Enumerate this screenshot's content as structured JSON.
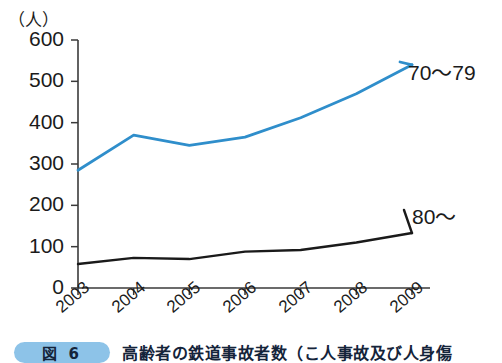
{
  "chart_data": {
    "type": "line",
    "title": "",
    "xlabel": "",
    "ylabel": "（人）",
    "ylim": [
      0,
      600
    ],
    "yticks": [
      "0",
      "100",
      "200",
      "300",
      "400",
      "500",
      "600"
    ],
    "ytick_values": [
      0,
      100,
      200,
      300,
      400,
      500,
      600
    ],
    "grid": false,
    "legend_position": "inline-right",
    "categories": [
      "2003",
      "2004",
      "2005",
      "2006",
      "2007",
      "2008",
      "2009"
    ],
    "series": [
      {
        "name": "70～79",
        "color": "#2f8ecb",
        "values": [
          285,
          370,
          345,
          365,
          412,
          470,
          540
        ]
      },
      {
        "name": "80～",
        "color": "#1a1a1a",
        "values": [
          58,
          73,
          70,
          88,
          92,
          110,
          133
        ]
      }
    ]
  },
  "caption": {
    "badge": "図 6",
    "text": "高齢者の鉄道事故者数（こ人事故及び人身傷"
  }
}
